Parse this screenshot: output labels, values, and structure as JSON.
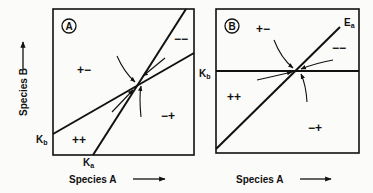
{
  "figure": {
    "panels": [
      {
        "id": "A",
        "badge": "A",
        "y_axis_label": "Species B",
        "x_axis_label": "Species A",
        "intercept_labels": {
          "y": "K",
          "y_sub": "b",
          "x": "K",
          "x_sub": "a"
        },
        "regions": [
          {
            "label": "+−",
            "position": "upper-left"
          },
          {
            "label": "−−",
            "position": "upper-right"
          },
          {
            "label": "++",
            "position": "lower-left"
          },
          {
            "label": "−+",
            "position": "lower-right"
          }
        ],
        "description": "Two isoclines (from K_b on B axis and K_a on A axis) crossing at a stable equilibrium; arrows converge on the intersection"
      },
      {
        "id": "B",
        "badge": "B",
        "x_axis_label": "Species A",
        "intercept_labels": {
          "y": "K",
          "y_sub": "b",
          "line": "E",
          "line_sub": "a"
        },
        "regions": [
          {
            "label": "+−",
            "position": "upper-left"
          },
          {
            "label": "−−",
            "position": "upper-right"
          },
          {
            "label": "++",
            "position": "lower-left"
          },
          {
            "label": "−+",
            "position": "lower-right"
          }
        ],
        "description": "Horizontal isocline at K_b and diagonal isocline E_a crossing at an equilibrium; arrows converge on the intersection"
      }
    ],
    "colors": {
      "ink": "#111111",
      "paper": "#fbfbf9"
    }
  }
}
